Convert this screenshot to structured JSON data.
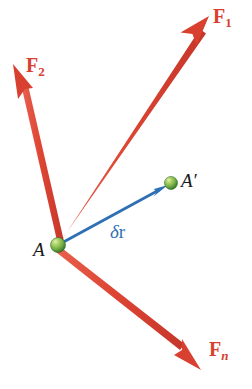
{
  "figure": {
    "background_color": "#ffffff",
    "width": 252,
    "height": 389
  },
  "colors": {
    "force_red": "#d8402f",
    "force_red_shaft": "#e04a3c",
    "displacement_blue": "#2f6fb4",
    "point_green_light": "#b8d96a",
    "point_green_mid": "#78b24a",
    "point_green_dark": "#3f7a2e",
    "text_black": "#1a1a1a"
  },
  "points": [
    {
      "id": "A",
      "label": "A",
      "label_name": "point-label-a",
      "x": 58,
      "y": 245,
      "radius": 7,
      "label_x": 33,
      "label_y": 240
    },
    {
      "id": "Aprime",
      "label": "A′",
      "label_name": "point-label-a-prime",
      "x": 171,
      "y": 183,
      "radius": 6,
      "label_x": 181,
      "label_y": 171
    }
  ],
  "vectors": [
    {
      "id": "F1",
      "label_base": "F",
      "label_sub": "1",
      "sub_style": "roman",
      "kind": "force",
      "color": "#d8402f",
      "from_x": 58,
      "from_y": 245,
      "to_x": 209,
      "to_y": 16,
      "shaft_width": 7,
      "head_length": 26,
      "head_width": 19,
      "label_x": 213,
      "label_y": 6
    },
    {
      "id": "F2",
      "label_base": "F",
      "label_sub": "2",
      "sub_style": "roman",
      "kind": "force",
      "color": "#d8402f",
      "from_x": 58,
      "from_y": 245,
      "to_x": 13,
      "to_y": 64,
      "shaft_width": 7,
      "head_length": 26,
      "head_width": 19,
      "label_x": 26,
      "label_y": 55
    },
    {
      "id": "Fn",
      "label_base": "F",
      "label_sub": "n",
      "sub_style": "italic",
      "kind": "force",
      "color": "#d8402f",
      "from_x": 58,
      "from_y": 245,
      "to_x": 201,
      "to_y": 370,
      "shaft_width": 7,
      "head_length": 24,
      "head_width": 18,
      "label_x": 209,
      "label_y": 339
    },
    {
      "id": "dr",
      "label_base": "δ",
      "label_sub": "r",
      "sub_style": "none",
      "kind": "displacement",
      "color": "#2f6fb4",
      "from_x": 58,
      "from_y": 245,
      "to_x": 168,
      "to_y": 185,
      "shaft_width": 2.6,
      "head_length": 13,
      "head_width": 9,
      "label_x": 110,
      "label_y": 222
    }
  ],
  "labels": {
    "f1": "F",
    "f1_sub": "1",
    "f2": "F",
    "f2_sub": "2",
    "fn": "F",
    "fn_sub": "n",
    "a": "A",
    "a_prime": "A′",
    "delta": "δ",
    "r": "r"
  }
}
